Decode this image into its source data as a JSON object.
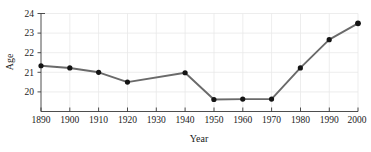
{
  "chart_data": {
    "type": "line",
    "title": "",
    "xlabel": "Year",
    "ylabel": "Age",
    "x": [
      1890,
      1900,
      1910,
      1920,
      1930,
      1940,
      1950,
      1960,
      1970,
      1980,
      1990,
      2000
    ],
    "categories": [
      "1890",
      "1900",
      "1910",
      "1920",
      "1930",
      "1940",
      "1950",
      "1960",
      "1970",
      "1980",
      "1990",
      "2000"
    ],
    "values": [
      21.6,
      21.5,
      21.3,
      20.85,
      null,
      21.28,
      20.05,
      20.07,
      20.07,
      21.5,
      22.8,
      23.55
    ],
    "points": [
      {
        "x": 1890,
        "y": 21.6
      },
      {
        "x": 1900,
        "y": 21.5
      },
      {
        "x": 1910,
        "y": 21.3
      },
      {
        "x": 1920,
        "y": 20.85
      },
      {
        "x": 1940,
        "y": 21.28
      },
      {
        "x": 1950,
        "y": 20.05
      },
      {
        "x": 1960,
        "y": 20.07
      },
      {
        "x": 1970,
        "y": 20.07
      },
      {
        "x": 1980,
        "y": 21.5
      },
      {
        "x": 1990,
        "y": 22.8
      },
      {
        "x": 2000,
        "y": 23.55
      }
    ],
    "xtick_labels": [
      "1890",
      "1900",
      "1910",
      "1920",
      "1930",
      "1940",
      "1950",
      "1960",
      "1970",
      "1980",
      "1990",
      "2000"
    ],
    "ytick_labels": [
      "20",
      "21",
      "22",
      "23",
      "24"
    ],
    "ytick_values": [
      20,
      21,
      22,
      23,
      24
    ],
    "xlim": [
      1890,
      2000
    ],
    "ylim": [
      19.5,
      24
    ],
    "grid": true,
    "legend": false,
    "series_color": "#6a6a6a",
    "marker_color": "#141414",
    "grid_color": "#e9e9e9",
    "axis_color": "#3a3a3a",
    "background_color": "#ffffff"
  },
  "axes": {
    "y_title": "Age",
    "x_title": "Year"
  }
}
